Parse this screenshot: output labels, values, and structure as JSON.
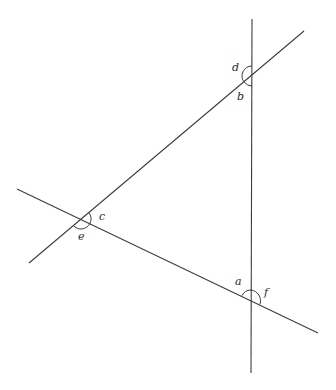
{
  "figure": {
    "type": "angles-at-intersections",
    "width": 336,
    "height": 390,
    "line_color": "#3d3d3d",
    "lines": [
      {
        "id": "line-vertical",
        "x1": 252,
        "y1": 19,
        "x2": 251,
        "y2": 373
      },
      {
        "id": "line-upper-diagonal",
        "x1": 304,
        "y1": 31,
        "x2": 29,
        "y2": 263
      },
      {
        "id": "line-lower-diagonal",
        "x1": 17,
        "y1": 189,
        "x2": 318,
        "y2": 333
      }
    ],
    "intersections": [
      {
        "id": "top",
        "x": 252,
        "y": 76,
        "angles": [
          "d",
          "b"
        ]
      },
      {
        "id": "left",
        "x": 81,
        "y": 219,
        "angles": [
          "c",
          "e"
        ]
      },
      {
        "id": "bottom",
        "x": 251,
        "y": 300,
        "angles": [
          "a",
          "f"
        ]
      }
    ],
    "angle_labels": {
      "a": "a",
      "b": "b",
      "c": "c",
      "d": "d",
      "e": "e",
      "f": "f"
    }
  }
}
